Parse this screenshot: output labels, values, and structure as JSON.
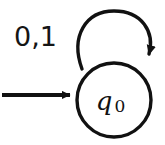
{
  "figure": {
    "type": "finite-state-automaton-diagram",
    "background_color": "#ffffff",
    "stroke_color": "#111111"
  },
  "states": [
    {
      "id": "q0",
      "label_main": "q",
      "label_subscript": "0",
      "label_full": "q0",
      "shape": "circle",
      "accepting": false,
      "is_start": true,
      "center_x": 114,
      "center_y": 100,
      "radius": 37
    }
  ],
  "transitions": [
    {
      "id": "self-loop-q0",
      "from": "q0",
      "to": "q0",
      "label": "0,1",
      "symbols": [
        "0",
        "1"
      ],
      "kind": "self-loop",
      "label_x": 14,
      "label_y": 46
    }
  ],
  "start_arrow": {
    "label": "",
    "from_x": 2,
    "to_x": 76,
    "y": 95
  }
}
